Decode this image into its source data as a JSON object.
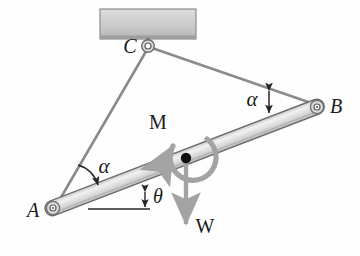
{
  "figure": {
    "background_color": "#fefefe"
  },
  "colors": {
    "bar_fill_light": "#e6e6e6",
    "bar_fill_mid": "#c9c9c9",
    "bar_stroke": "#6e6e6e",
    "cable_stroke": "#8a8a8a",
    "ceiling_fill": "#cfcfcf",
    "ceiling_stroke": "#8c8c8c",
    "arrow_gray": "#a0a0a0",
    "label_color": "#1b1b1b",
    "pin_hub": "#ffffff",
    "center_dot": "#111111"
  },
  "labels": {
    "point_a": "A",
    "point_b": "B",
    "point_c": "C",
    "moment": "M",
    "weight": "W",
    "alpha_left": "α",
    "alpha_right": "α",
    "theta": "θ"
  },
  "geometry": {
    "point_a": {
      "x": 53,
      "y": 208
    },
    "point_b": {
      "x": 317,
      "y": 107
    },
    "point_c": {
      "x": 148,
      "y": 46
    },
    "bar_center": {
      "x": 186,
      "y": 158
    },
    "bar_half_thickness": 7,
    "bar_angle_deg": -21,
    "ceiling": {
      "x": 100,
      "y": 9,
      "width": 96,
      "height": 30
    },
    "theta_reference_line": {
      "x1": 88,
      "y1": 209,
      "x2": 150,
      "y2": 209
    },
    "weight_arrow": {
      "x1": 186,
      "y1": 158,
      "x2": 186,
      "y2": 228
    }
  },
  "label_positions": {
    "point_a": {
      "x": 33,
      "y": 217
    },
    "point_b": {
      "x": 334,
      "y": 113
    },
    "point_c": {
      "x": 129,
      "y": 52
    },
    "moment": {
      "x": 152,
      "y": 128
    },
    "weight": {
      "x": 196,
      "y": 232
    },
    "alpha_left": {
      "x": 94,
      "y": 171
    },
    "alpha_right": {
      "x": 249,
      "y": 107
    },
    "theta": {
      "x": 153,
      "y": 202
    }
  },
  "annotations": {
    "alpha_left_desc": "angle between cable AC and bar near A",
    "alpha_right_desc": "angle between cable CB and bar near B",
    "theta_desc": "inclination of bar AB above horizontal reference",
    "moment_desc": "counterclockwise applied couple M at bar center",
    "weight_desc": "downward weight W acting at bar center"
  }
}
